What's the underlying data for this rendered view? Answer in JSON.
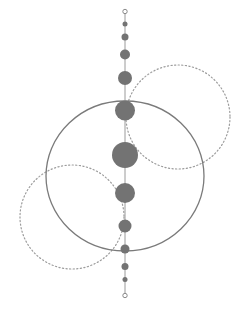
{
  "diagram": {
    "colors": {
      "background": "#ffffff",
      "node_fill": "#737373",
      "axis_stroke": "#9a9a9a",
      "ring_stroke": "#7a7a7a",
      "dotted_stroke": "#9c9c9c",
      "endpoint_stroke": "#8a8a8a"
    },
    "axis": {
      "x": 125,
      "y1": 12,
      "y2": 295
    },
    "endpoints": [
      {
        "cx": 125,
        "cy": 11.5,
        "r": 2.2
      },
      {
        "cx": 125,
        "cy": 295.5,
        "r": 2.2
      }
    ],
    "nodes": [
      {
        "cx": 125,
        "cy": 24,
        "r": 2.5
      },
      {
        "cx": 125,
        "cy": 37,
        "r": 3.5
      },
      {
        "cx": 125,
        "cy": 54.5,
        "r": 5
      },
      {
        "cx": 125,
        "cy": 78,
        "r": 7
      },
      {
        "cx": 125,
        "cy": 110.5,
        "r": 10
      },
      {
        "cx": 125,
        "cy": 155,
        "r": 13
      },
      {
        "cx": 125,
        "cy": 193,
        "r": 10
      },
      {
        "cx": 125,
        "cy": 226,
        "r": 6.5
      },
      {
        "cx": 125,
        "cy": 249,
        "r": 4.5
      },
      {
        "cx": 125,
        "cy": 266.5,
        "r": 3.5
      },
      {
        "cx": 125,
        "cy": 279.5,
        "r": 2.5
      }
    ],
    "main_ring": {
      "cx": 125,
      "cy": 176,
      "rx": 79,
      "ry": 75
    },
    "dotted_rings": [
      {
        "name": "upper-right",
        "cx": 178,
        "cy": 117,
        "r": 52
      },
      {
        "name": "lower-left",
        "cx": 72,
        "cy": 217,
        "r": 52
      }
    ]
  }
}
